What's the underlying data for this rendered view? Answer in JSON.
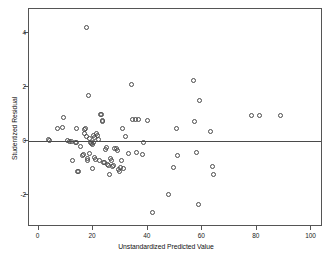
{
  "chart_data": {
    "type": "scatter",
    "title": "",
    "xlabel": "Unstandardized Predicted Value",
    "ylabel": "Studentized Residual",
    "xlim": [
      -3.5,
      103.5
    ],
    "ylim": [
      -3.1,
      4.9
    ],
    "xticks": [
      0,
      20,
      40,
      60,
      80,
      100
    ],
    "xticklabels": [
      "0",
      "20",
      "40",
      "60",
      "80",
      "100"
    ],
    "yticks": [
      -2,
      0,
      2,
      4
    ],
    "yticklabels": [
      "-2",
      "0",
      "2",
      "4"
    ],
    "grid": false,
    "legend": null,
    "reference_line": {
      "orientation": "horizontal",
      "y": 0,
      "color": "#4a4a4a"
    },
    "marker": {
      "shape": "circle-open",
      "edge_color": "#4a4a4a",
      "size": 5
    },
    "points": [
      [
        3.6,
        0.05
      ],
      [
        4.0,
        0.02
      ],
      [
        7.0,
        0.48
      ],
      [
        8.6,
        0.52
      ],
      [
        9.2,
        0.88
      ],
      [
        10.5,
        0.02
      ],
      [
        11.2,
        0.0
      ],
      [
        12.0,
        -0.02
      ],
      [
        12.6,
        -0.72
      ],
      [
        13.4,
        -0.03
      ],
      [
        13.8,
        0.47
      ],
      [
        14.0,
        -0.05
      ],
      [
        14.2,
        -1.12
      ],
      [
        14.8,
        -1.1
      ],
      [
        15.2,
        -0.18
      ],
      [
        16.0,
        -0.52
      ],
      [
        16.4,
        -0.48
      ],
      [
        16.8,
        0.3
      ],
      [
        17.0,
        0.42
      ],
      [
        17.2,
        0.46
      ],
      [
        17.4,
        0.18
      ],
      [
        17.6,
        4.2
      ],
      [
        17.8,
        -0.62
      ],
      [
        18.0,
        -0.72
      ],
      [
        18.4,
        1.68
      ],
      [
        18.6,
        0.12
      ],
      [
        18.8,
        -0.46
      ],
      [
        19.0,
        -0.05
      ],
      [
        19.4,
        -0.08
      ],
      [
        19.6,
        -0.1
      ],
      [
        19.8,
        -1.0
      ],
      [
        20.0,
        0.22
      ],
      [
        20.2,
        -0.06
      ],
      [
        20.4,
        0.14
      ],
      [
        20.6,
        -0.6
      ],
      [
        20.8,
        -0.68
      ],
      [
        21.2,
        0.3
      ],
      [
        21.6,
        0.2
      ],
      [
        22.0,
        0.07
      ],
      [
        22.4,
        -0.7
      ],
      [
        22.8,
        0.98
      ],
      [
        23.2,
        1.0
      ],
      [
        23.4,
        0.72
      ],
      [
        23.6,
        0.76
      ],
      [
        23.8,
        -0.78
      ],
      [
        24.2,
        -0.8
      ],
      [
        24.6,
        -0.3
      ],
      [
        25.0,
        -0.22
      ],
      [
        25.4,
        -0.86
      ],
      [
        25.8,
        -0.88
      ],
      [
        26.0,
        -1.24
      ],
      [
        26.4,
        -0.62
      ],
      [
        26.8,
        -0.7
      ],
      [
        27.2,
        -0.92
      ],
      [
        27.6,
        -0.9
      ],
      [
        28.0,
        -0.28
      ],
      [
        28.4,
        -0.26
      ],
      [
        28.8,
        -0.34
      ],
      [
        29.2,
        -1.05
      ],
      [
        29.6,
        -1.12
      ],
      [
        30.0,
        -0.98
      ],
      [
        30.4,
        -0.72
      ],
      [
        30.6,
        0.48
      ],
      [
        31.0,
        -1.0
      ],
      [
        32.0,
        0.16
      ],
      [
        33.0,
        -0.46
      ],
      [
        34.2,
        2.1
      ],
      [
        34.6,
        0.8
      ],
      [
        35.4,
        0.82
      ],
      [
        36.0,
        -0.42
      ],
      [
        36.6,
        0.8
      ],
      [
        38.2,
        -0.5
      ],
      [
        38.6,
        -0.05
      ],
      [
        40.0,
        0.78
      ],
      [
        41.8,
        -2.62
      ],
      [
        47.8,
        -1.98
      ],
      [
        49.6,
        -0.98
      ],
      [
        50.6,
        0.48
      ],
      [
        51.0,
        -0.52
      ],
      [
        56.6,
        2.24
      ],
      [
        57.0,
        0.72
      ],
      [
        58.0,
        -0.42
      ],
      [
        58.6,
        -2.34
      ],
      [
        59.0,
        1.5
      ],
      [
        63.0,
        0.38
      ],
      [
        63.8,
        -0.94
      ],
      [
        64.2,
        -1.22
      ],
      [
        78.0,
        0.95
      ],
      [
        80.8,
        0.97
      ],
      [
        88.6,
        0.95
      ]
    ]
  }
}
